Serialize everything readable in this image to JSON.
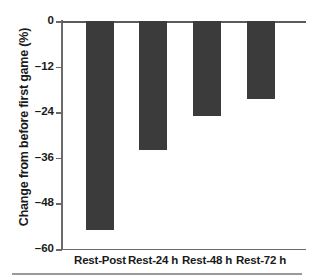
{
  "chart_data": {
    "type": "bar",
    "title": "",
    "xlabel": "",
    "ylabel": "Change from before first game (%)",
    "categories": [
      "Rest-Post",
      "Rest-24 h",
      "Rest-48 h",
      "Rest-72 h"
    ],
    "values": [
      -55.0,
      -34.0,
      -25.0,
      -20.5
    ],
    "yticks": [
      0,
      -12,
      -24,
      -36,
      -48,
      -60
    ],
    "ytick_labels": [
      "0",
      "–12",
      "–24",
      "–36",
      "–48",
      "–60"
    ],
    "ylim": [
      -60,
      0
    ],
    "grid": false,
    "legend": null,
    "bar_color": "#3b3b3b",
    "axis_color": "#6a6a6a"
  }
}
